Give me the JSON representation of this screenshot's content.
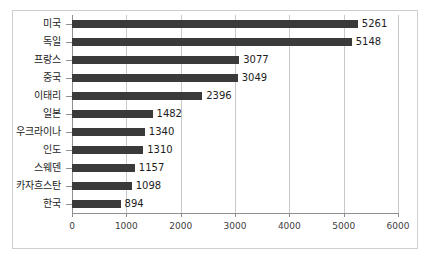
{
  "chart_data": {
    "type": "bar",
    "orientation": "horizontal",
    "title": "",
    "subtitle": "",
    "xlabel": "",
    "ylabel": "",
    "xlim": [
      0,
      6000
    ],
    "xticks": [
      "0",
      "1000",
      "2000",
      "3000",
      "4000",
      "5000",
      "6000"
    ],
    "xtick_values": [
      0,
      1000,
      2000,
      3000,
      4000,
      5000,
      6000
    ],
    "grid": true,
    "legend": false,
    "legend_position": "none",
    "bar_color": "#3a3a3a",
    "gridline_color": "#c8c8c8",
    "axis_color": "#8f8f8f",
    "border_color": "#cfcfcf",
    "background_color": "#ffffff",
    "categories": [
      "미국",
      "독일",
      "프랑스",
      "중국",
      "이태리",
      "일본",
      "우크라이나",
      "인도",
      "스웨덴",
      "카자흐스탄",
      "한국"
    ],
    "values": [
      5261,
      5148,
      3077,
      3049,
      2396,
      1482,
      1340,
      1310,
      1157,
      1098,
      894
    ],
    "value_labels": [
      "5261",
      "5148",
      "3077",
      "3049",
      "2396",
      "1482",
      "1340",
      "1310",
      "1157",
      "1098",
      "894"
    ]
  }
}
